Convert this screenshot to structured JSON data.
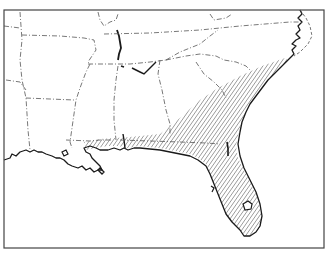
{
  "map": {
    "region": "Southeastern United States",
    "style": "black-and-white line map",
    "frame": {
      "x": 4,
      "y": 10,
      "width": 320,
      "height": 238
    },
    "colors": {
      "background": "#ffffff",
      "coast": "#1a1a1a",
      "border": "#555555",
      "hatch": "#333333",
      "frame": "#444444"
    },
    "legend": [],
    "layers": [
      {
        "name": "state-borders",
        "style": "dash-dot lines"
      },
      {
        "name": "coastline",
        "style": "solid black line"
      },
      {
        "name": "range-area",
        "style": "diagonal hatching",
        "extent": "Atlantic and Gulf coastal plain, southeastern Virginia and North Carolina through Florida and the Gulf coast"
      }
    ]
  }
}
